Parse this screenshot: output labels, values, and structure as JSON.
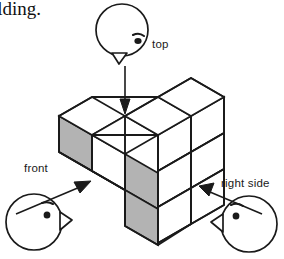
{
  "page": {
    "width": 284,
    "height": 259,
    "background": "#ffffff",
    "partial_text": "ilding."
  },
  "colors": {
    "stroke": "#1a1a1a",
    "face_top": "#ffffff",
    "face_right": "#ffffff",
    "face_left_shaded": "#b3b3b3",
    "text": "#1a1a1a",
    "arrow": "#1a1a1a"
  },
  "figure": {
    "type": "isometric-cube-stack",
    "viewpoints": [
      {
        "id": "top",
        "label": "top",
        "label_x": 152,
        "label_y": 38,
        "head_cx": 122,
        "head_cy": 30,
        "head_r": 26,
        "facing": "down",
        "arrow_from_x": 125,
        "arrow_from_y": 64,
        "arrow_to_x": 125,
        "arrow_to_y": 113
      },
      {
        "id": "front",
        "label": "front",
        "label_x": 24,
        "label_y": 162,
        "head_cx": 34,
        "head_cy": 222,
        "head_r": 28,
        "facing": "right",
        "arrow_from_x": 54,
        "arrow_from_y": 211,
        "arrow_to_x": 94,
        "arrow_to_y": 180
      },
      {
        "id": "right-side",
        "label": "right side",
        "label_x": 221,
        "label_y": 177,
        "head_cx": 249,
        "head_cy": 224,
        "head_r": 28,
        "facing": "left",
        "arrow_from_x": 234,
        "arrow_from_y": 211,
        "arrow_to_x": 201,
        "arrow_to_y": 188
      }
    ],
    "cube_geometry": {
      "iso_dx": 33,
      "iso_dy": 19,
      "cube_height": 36,
      "origin_x": 125,
      "origin_y": 116
    },
    "faces": [
      {
        "name": "top-face-back-left",
        "kind": "top",
        "fill": "#ffffff",
        "points": "59,116 92,97 125,116 92,135"
      },
      {
        "name": "top-face-center",
        "kind": "top",
        "fill": "#ffffff",
        "points": "92,135 125,116 158,135 125,154"
      },
      {
        "name": "top-face-back-right",
        "kind": "top",
        "fill": "#ffffff",
        "points": "125,116 158,97 191,116 158,135"
      },
      {
        "name": "top-face-far-right",
        "kind": "top",
        "fill": "#ffffff",
        "points": "158,97 191,78 224,97 191,116"
      },
      {
        "name": "left-face-upper-a",
        "kind": "left",
        "fill": "#b3b3b3",
        "points": "59,116 92,135 92,171 59,152"
      },
      {
        "name": "left-face-upper-b",
        "kind": "left",
        "fill": "#b3b3b3",
        "points": "92,135 125,154 125,190 92,171"
      },
      {
        "name": "left-face-mid",
        "kind": "left",
        "fill": "#b3b3b3",
        "points": "125,154 158,173 158,209 125,190"
      },
      {
        "name": "left-face-lower",
        "kind": "left",
        "fill": "#b3b3b3",
        "points": "125,190 158,209 158,245 125,226"
      },
      {
        "name": "right-face-top-a",
        "kind": "right",
        "fill": "#ffffff",
        "points": "92,135 125,154 125,190 92,171"
      },
      {
        "name": "right-face-top-b",
        "kind": "right",
        "fill": "#ffffff",
        "points": "158,135 191,116 191,152 158,171"
      },
      {
        "name": "right-face-top-c",
        "kind": "right",
        "fill": "#ffffff",
        "points": "191,116 224,97 224,133 191,152"
      },
      {
        "name": "right-face-mid-b",
        "kind": "right",
        "fill": "#ffffff",
        "points": "158,171 191,152 191,188 158,207"
      },
      {
        "name": "right-face-mid-c",
        "kind": "right",
        "fill": "#ffffff",
        "points": "191,152 224,133 224,169 191,188"
      },
      {
        "name": "right-face-low-b",
        "kind": "right",
        "fill": "#ffffff",
        "points": "158,207 191,188 191,224 158,243"
      },
      {
        "name": "right-face-low-c",
        "kind": "right",
        "fill": "#ffffff",
        "points": "191,188 224,169 224,205 191,224"
      }
    ]
  }
}
